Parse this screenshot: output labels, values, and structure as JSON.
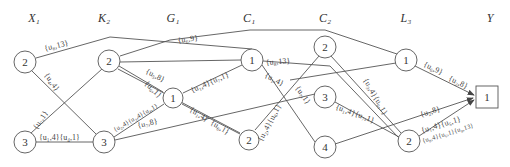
{
  "columns": [
    {
      "id": "X",
      "label": "X₁",
      "x": 34
    },
    {
      "id": "K",
      "label": "K₂",
      "x": 104
    },
    {
      "id": "G",
      "label": "G₁",
      "x": 173
    },
    {
      "id": "C1",
      "label": "C₁",
      "x": 249
    },
    {
      "id": "C2",
      "label": "C₂",
      "x": 325
    },
    {
      "id": "L",
      "label": "L₃",
      "x": 406
    },
    {
      "id": "Y",
      "label": "Y",
      "x": 490
    }
  ],
  "nodes": [
    {
      "id": "X2",
      "label": "2",
      "x": 25,
      "y": 62,
      "shape": "circle"
    },
    {
      "id": "X3",
      "label": "3",
      "x": 25,
      "y": 142,
      "shape": "circle"
    },
    {
      "id": "K2",
      "label": "2",
      "x": 109,
      "y": 61,
      "shape": "circle"
    },
    {
      "id": "K3",
      "label": "3",
      "x": 104,
      "y": 142,
      "shape": "circle"
    },
    {
      "id": "G1",
      "label": "1",
      "x": 173,
      "y": 98,
      "shape": "circle"
    },
    {
      "id": "C1_1",
      "label": "1",
      "x": 252,
      "y": 60,
      "shape": "circle"
    },
    {
      "id": "C1_2",
      "label": "2",
      "x": 249,
      "y": 140,
      "shape": "circle"
    },
    {
      "id": "C2_2",
      "label": "2",
      "x": 325,
      "y": 47,
      "shape": "circle"
    },
    {
      "id": "C2_3",
      "label": "3",
      "x": 325,
      "y": 97,
      "shape": "circle"
    },
    {
      "id": "C2_4",
      "label": "4",
      "x": 325,
      "y": 147,
      "shape": "circle"
    },
    {
      "id": "L1",
      "label": "1",
      "x": 406,
      "y": 60,
      "shape": "circle"
    },
    {
      "id": "L2",
      "label": "2",
      "x": 409,
      "y": 141,
      "shape": "circle"
    },
    {
      "id": "Y1",
      "label": "1",
      "x": 486,
      "y": 97,
      "shape": "box"
    }
  ],
  "edge_labels": [
    {
      "text": "{u₈,13}",
      "x": 45,
      "y": 51,
      "rot": -14
    },
    {
      "text": "{u₄,4}",
      "x": 44,
      "y": 75,
      "rot": 55
    },
    {
      "text": "{u₇,1}",
      "x": 37,
      "y": 130,
      "rot": -57
    },
    {
      "text": "{u₁,4}{u₄,1}",
      "x": 39,
      "y": 140,
      "rot": 0
    },
    {
      "text": "{u₆,9}",
      "x": 178,
      "y": 43,
      "rot": -8
    },
    {
      "text": "{u₅,8}",
      "x": 145,
      "y": 73,
      "rot": 27
    },
    {
      "text": "{u₆,1}",
      "x": 144,
      "y": 84,
      "rot": 44
    },
    {
      "text": "{u₁,4}{u₇,1}",
      "x": 192,
      "y": 93,
      "rot": -24
    },
    {
      "text": "{u₂,4}{u₃,4}{u₄,1}",
      "x": 115,
      "y": 132,
      "rot": -30,
      "small": true
    },
    {
      "text": "{u₇,8}",
      "x": 138,
      "y": 128,
      "rot": -13
    },
    {
      "text": "{u₁,4}",
      "x": 189,
      "y": 111,
      "rot": 32
    },
    {
      "text": "{u₆,1}",
      "x": 210,
      "y": 124,
      "rot": 32
    },
    {
      "text": "{u₈,13}",
      "x": 266,
      "y": 65,
      "rot": -4
    },
    {
      "text": "{u₁,4}",
      "x": 264,
      "y": 77,
      "rot": 27
    },
    {
      "text": "{u₂,4}{u₆,1}",
      "x": 262,
      "y": 142,
      "rot": -62
    },
    {
      "text": "{u₇,1}",
      "x": 295,
      "y": 88,
      "rot": 55
    },
    {
      "text": "{u₃,4}{u₆,1}",
      "x": 363,
      "y": 80,
      "rot": 60
    },
    {
      "text": "{u₁,4}{u₇,1}",
      "x": 335,
      "y": 109,
      "rot": 20
    },
    {
      "text": "{u₆,9}",
      "x": 423,
      "y": 66,
      "rot": 26
    },
    {
      "text": "{u₂,8}",
      "x": 448,
      "y": 80,
      "rot": 26
    },
    {
      "text": "{u₂,8}",
      "x": 421,
      "y": 117,
      "rot": -17
    },
    {
      "text": "{u₁,4}{u₅,1}",
      "x": 422,
      "y": 133,
      "rot": -17
    },
    {
      "text": "{u₈,4}{u₆,1}{u₈,13}",
      "x": 423,
      "y": 143,
      "rot": -17,
      "small": true
    }
  ]
}
